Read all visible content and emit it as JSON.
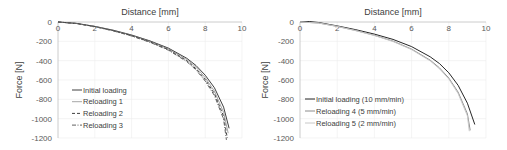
{
  "chart_data": [
    {
      "type": "line",
      "xlabel": "Distance [mm]",
      "ylabel": "Force [N]",
      "xlim": [
        0,
        10
      ],
      "ylim": [
        -1200,
        0
      ],
      "xticks": [
        "0",
        "2",
        "4",
        "6",
        "8",
        "10"
      ],
      "yticks": [
        "0",
        "-200",
        "-400",
        "-600",
        "-800",
        "-1000",
        "-1200"
      ],
      "grid": true,
      "legend_position": "lower-left inside",
      "series": [
        {
          "name": "Initial loading",
          "style": "solid",
          "color": "#404040",
          "x": [
            0,
            1,
            2,
            3,
            4,
            5,
            6,
            7,
            7.5,
            8,
            8.5,
            9,
            9.3
          ],
          "y": [
            0,
            -15,
            -45,
            -85,
            -135,
            -195,
            -270,
            -375,
            -450,
            -550,
            -680,
            -880,
            -1100
          ]
        },
        {
          "name": "Reloading 1",
          "style": "thin",
          "color": "#808080",
          "x": [
            0,
            1,
            2,
            3,
            4,
            5,
            6,
            7,
            7.5,
            8,
            8.5,
            9,
            9.25
          ],
          "y": [
            0,
            -15,
            -46,
            -87,
            -138,
            -200,
            -278,
            -388,
            -468,
            -575,
            -715,
            -935,
            -1150
          ]
        },
        {
          "name": "Reloading 2",
          "style": "dashed",
          "color": "#404040",
          "x": [
            0,
            1,
            2,
            3,
            4,
            5,
            6,
            7,
            7.5,
            8,
            8.5,
            9,
            9.2
          ],
          "y": [
            0,
            -16,
            -48,
            -90,
            -142,
            -206,
            -286,
            -400,
            -484,
            -595,
            -740,
            -975,
            -1200
          ]
        },
        {
          "name": "Reloading 3",
          "style": "dashdot",
          "color": "#606060",
          "x": [
            0,
            1,
            2,
            3,
            4,
            5,
            6,
            7,
            7.5,
            8,
            8.5,
            9,
            9.15
          ],
          "y": [
            0,
            -16,
            -49,
            -92,
            -145,
            -210,
            -292,
            -410,
            -496,
            -610,
            -760,
            -1005,
            -1220
          ]
        }
      ]
    },
    {
      "type": "line",
      "xlabel": "Distance [mm]",
      "ylabel": "Force [N]",
      "xlim": [
        0,
        10
      ],
      "ylim": [
        -1200,
        0
      ],
      "xticks": [
        "0",
        "2",
        "4",
        "6",
        "8",
        "10"
      ],
      "yticks": [
        "0",
        "-200",
        "-400",
        "-600",
        "-800",
        "-1000",
        "-1200"
      ],
      "grid": true,
      "legend_position": "lower-left inside",
      "series": [
        {
          "name": "Initial loading (10 mm/min)",
          "style": "solid",
          "color": "#262626",
          "x": [
            0,
            0.5,
            1,
            2,
            3,
            4,
            5,
            6,
            7,
            7.5,
            8,
            8.5,
            9,
            9.4
          ],
          "y": [
            0,
            5,
            -5,
            -40,
            -80,
            -125,
            -180,
            -255,
            -360,
            -430,
            -525,
            -655,
            -840,
            -1060
          ]
        },
        {
          "name": "Reloading 4 (5 mm/min)",
          "style": "solid",
          "color": "#8c8c8c",
          "x": [
            0,
            1,
            2,
            3,
            4,
            5,
            6,
            7,
            7.5,
            8,
            8.5,
            9,
            9.15
          ],
          "y": [
            0,
            -10,
            -45,
            -88,
            -138,
            -198,
            -280,
            -395,
            -475,
            -580,
            -725,
            -950,
            -1120
          ]
        },
        {
          "name": "Reloading 5 (2 mm/min)",
          "style": "solid",
          "color": "#c8c8c8",
          "x": [
            0,
            1,
            2,
            3,
            4,
            5,
            6,
            7,
            7.5,
            8,
            8.5,
            9,
            9.1
          ],
          "y": [
            0,
            -10,
            -46,
            -90,
            -140,
            -202,
            -286,
            -402,
            -484,
            -590,
            -740,
            -970,
            -1130
          ]
        }
      ]
    }
  ],
  "panels": [
    {
      "xlabel": "Distance [mm]",
      "ylabel": "Force [N]",
      "legend": [
        "Initial loading",
        "Reloading 1",
        "Reloading 2",
        "Reloading 3"
      ]
    },
    {
      "xlabel": "Distance [mm]",
      "ylabel": "Force [N]",
      "legend": [
        "Initial loading (10 mm/min)",
        "Reloading 4 (5 mm/min)",
        "Reloading 5 (2 mm/min)"
      ]
    }
  ]
}
